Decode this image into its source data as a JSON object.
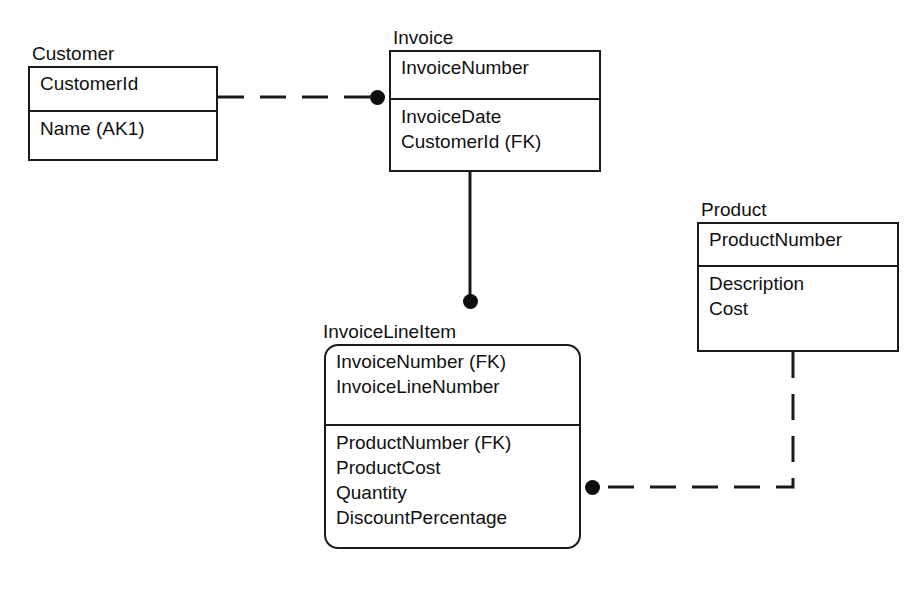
{
  "diagram": {
    "type": "entity-relationship-diagram",
    "notation": "IDEF1X",
    "background_color": "#ffffff",
    "line_color": "#1a1a1a",
    "entities": [
      {
        "id": "customer",
        "title": "Customer",
        "shape": "square-corners",
        "key_attributes": [
          "CustomerId"
        ],
        "attributes": [
          "Name (AK1)"
        ],
        "box": {
          "x": 28,
          "y": 66,
          "width": 190,
          "height": 95,
          "divider_y": 110
        },
        "title_pos": {
          "x": 30,
          "y": 41
        }
      },
      {
        "id": "invoice",
        "title": "Invoice",
        "shape": "square-corners",
        "key_attributes": [
          "InvoiceNumber"
        ],
        "attributes": [
          "InvoiceDate",
          "CustomerId (FK)"
        ],
        "box": {
          "x": 389,
          "y": 50,
          "width": 212,
          "height": 122,
          "divider_y": 98
        },
        "title_pos": {
          "x": 390,
          "y": 25
        }
      },
      {
        "id": "invoicelineitem",
        "title": "InvoiceLineItem",
        "shape": "rounded-corners",
        "key_attributes": [
          "InvoiceNumber (FK)",
          "InvoiceLineNumber"
        ],
        "attributes": [
          "ProductNumber (FK)",
          "ProductCost",
          "Quantity",
          "DiscountPercentage"
        ],
        "box": {
          "x": 324,
          "y": 344,
          "width": 257,
          "height": 205,
          "divider_y": 424
        },
        "title_pos": {
          "x": 321,
          "y": 319
        }
      },
      {
        "id": "product",
        "title": "Product",
        "shape": "square-corners",
        "key_attributes": [
          "ProductNumber"
        ],
        "attributes": [
          "Description",
          "Cost"
        ],
        "box": {
          "x": 697,
          "y": 222,
          "width": 202,
          "height": 130,
          "divider_y": 265
        },
        "title_pos": {
          "x": 698,
          "y": 197
        }
      }
    ],
    "relationships": [
      {
        "id": "customer-invoice",
        "from": "customer",
        "to": "invoice",
        "style": "dashed",
        "meaning": "non-identifying",
        "child_dot": {
          "x": 377,
          "y": 97
        }
      },
      {
        "id": "invoice-invoicelineitem",
        "from": "invoice",
        "to": "invoicelineitem",
        "style": "solid",
        "meaning": "identifying",
        "child_dot": {
          "x": 470,
          "y": 301
        }
      },
      {
        "id": "product-invoicelineitem",
        "from": "product",
        "to": "invoicelineitem",
        "style": "dashed",
        "meaning": "non-identifying",
        "child_dot": {
          "x": 592,
          "y": 487
        }
      }
    ]
  }
}
